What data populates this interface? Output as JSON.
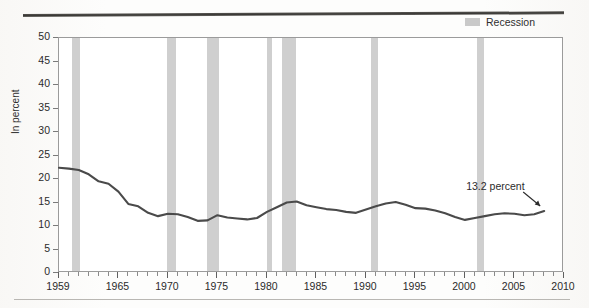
{
  "legend": {
    "swatch_name": "recession-swatch",
    "label": "Recession",
    "color": "#cfcfcf"
  },
  "axes": {
    "ylabel": "In percent",
    "yticks": [
      "0",
      "5",
      "10",
      "15",
      "20",
      "25",
      "30",
      "35",
      "40",
      "45",
      "50"
    ],
    "xticks": [
      "1959",
      "1965",
      "1970",
      "1975",
      "1980",
      "1985",
      "1990",
      "1995",
      "2000",
      "2005",
      "2010"
    ]
  },
  "annotation": {
    "text": "13.2 percent"
  },
  "chart_data": {
    "type": "line",
    "title": "",
    "subtitle": "",
    "xlabel": "",
    "ylabel": "In percent",
    "xlim": [
      1959,
      2010
    ],
    "ylim": [
      0,
      50
    ],
    "ytick_values": [
      0,
      5,
      10,
      15,
      20,
      25,
      30,
      35,
      40,
      45,
      50
    ],
    "xtick_values": [
      1959,
      1965,
      1970,
      1975,
      1980,
      1985,
      1990,
      1995,
      2000,
      2005,
      2010
    ],
    "grid": false,
    "legend_position": "top-right",
    "line_color": "#4a4a4a",
    "series": [
      {
        "name": "In percent",
        "x": [
          1959,
          1960,
          1961,
          1962,
          1963,
          1964,
          1965,
          1966,
          1967,
          1968,
          1969,
          1970,
          1971,
          1972,
          1973,
          1974,
          1975,
          1976,
          1977,
          1978,
          1979,
          1980,
          1981,
          1982,
          1983,
          1984,
          1985,
          1986,
          1987,
          1988,
          1989,
          1990,
          1991,
          1992,
          1993,
          1994,
          1995,
          1996,
          1997,
          1998,
          1999,
          2000,
          2001,
          2002,
          2003,
          2004,
          2005,
          2006,
          2007,
          2008
        ],
        "values": [
          22.4,
          22.2,
          21.9,
          21.0,
          19.5,
          19.0,
          17.3,
          14.7,
          14.2,
          12.8,
          12.1,
          12.6,
          12.5,
          11.9,
          11.1,
          11.2,
          12.3,
          11.8,
          11.6,
          11.4,
          11.7,
          13.0,
          14.0,
          15.0,
          15.2,
          14.4,
          14.0,
          13.6,
          13.4,
          13.0,
          12.8,
          13.5,
          14.2,
          14.8,
          15.1,
          14.5,
          13.8,
          13.7,
          13.3,
          12.7,
          11.9,
          11.3,
          11.7,
          12.1,
          12.5,
          12.7,
          12.6,
          12.3,
          12.5,
          13.2
        ],
        "endpoint_label": "13.2 percent"
      }
    ],
    "recession_bands": [
      {
        "start": 1960.3,
        "end": 1961.1
      },
      {
        "start": 1969.9,
        "end": 1970.8
      },
      {
        "start": 1973.9,
        "end": 1975.2
      },
      {
        "start": 1980.0,
        "end": 1980.5
      },
      {
        "start": 1981.5,
        "end": 1982.9
      },
      {
        "start": 1990.5,
        "end": 1991.2
      },
      {
        "start": 2001.2,
        "end": 2001.9
      }
    ]
  }
}
